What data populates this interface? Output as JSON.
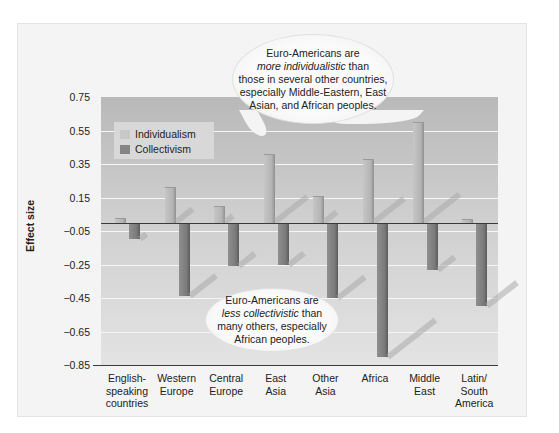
{
  "chart_data": {
    "type": "bar",
    "title": "",
    "xlabel": "",
    "ylabel": "Effect size",
    "ylim": [
      -0.85,
      0.75
    ],
    "yticks": [
      "0.75",
      "0.55",
      "0.35",
      "0.15",
      "−0.05",
      "−0.25",
      "−0.45",
      "−0.65",
      "−0.85"
    ],
    "grid": true,
    "legend_position": "upper left",
    "categories": [
      "English-speaking countries",
      "Western Europe",
      "Central Europe",
      "East Asia",
      "Other Asia",
      "Africa",
      "Middle East",
      "Latin/South America"
    ],
    "category_lines": [
      [
        "English-",
        "speaking",
        "countries"
      ],
      [
        "Western",
        "Europe"
      ],
      [
        "Central",
        "Europe"
      ],
      [
        "East",
        "Asia"
      ],
      [
        "Other",
        "Asia"
      ],
      [
        "Africa"
      ],
      [
        "Middle",
        "East"
      ],
      [
        "Latin/",
        "South",
        "America"
      ]
    ],
    "series": [
      {
        "name": "Individualism",
        "color": "#bdbdbd",
        "values": [
          0.03,
          0.21,
          0.1,
          0.41,
          0.16,
          0.38,
          0.6,
          0.02
        ]
      },
      {
        "name": "Collectivism",
        "color": "#7e7e7e",
        "values": [
          -0.1,
          -0.44,
          -0.26,
          -0.25,
          -0.45,
          -0.8,
          -0.28,
          -0.5
        ]
      }
    ],
    "annotations": [
      {
        "id": "top",
        "lines": [
          "Euro-Americans are",
          "more individualistic than",
          "those in several other countries,",
          "especially Middle-Eastern, East",
          "Asian, and African peoples."
        ],
        "italic": "more individualistic"
      },
      {
        "id": "bottom",
        "lines": [
          "Euro-Americans are",
          "less collectivistic than",
          "many others, especially",
          "African peoples."
        ],
        "italic": "less collectivistic"
      }
    ]
  },
  "legend": {
    "individualism": "Individualism",
    "collectivism": "Collectivism"
  },
  "axis": {
    "ylabel": "Effect size"
  },
  "annotation_top": {
    "line1": "Euro-Americans are",
    "line2_italic": "more individualistic",
    "line2_rest": " than",
    "line3": "those in several other countries,",
    "line4": "especially Middle-Eastern, East",
    "line5": "Asian, and African peoples."
  },
  "annotation_bottom": {
    "line1": "Euro-Americans are",
    "line2_italic": "less collectivistic",
    "line2_rest": " than",
    "line3": "many others, especially",
    "line4": "African peoples."
  },
  "colors": {
    "individualism": "#bdbdbd",
    "collectivism": "#7e7e7e",
    "plot_top": "#b9b9b9",
    "plot_bottom": "#e3e3e3",
    "panel": "#f4f4f4"
  }
}
